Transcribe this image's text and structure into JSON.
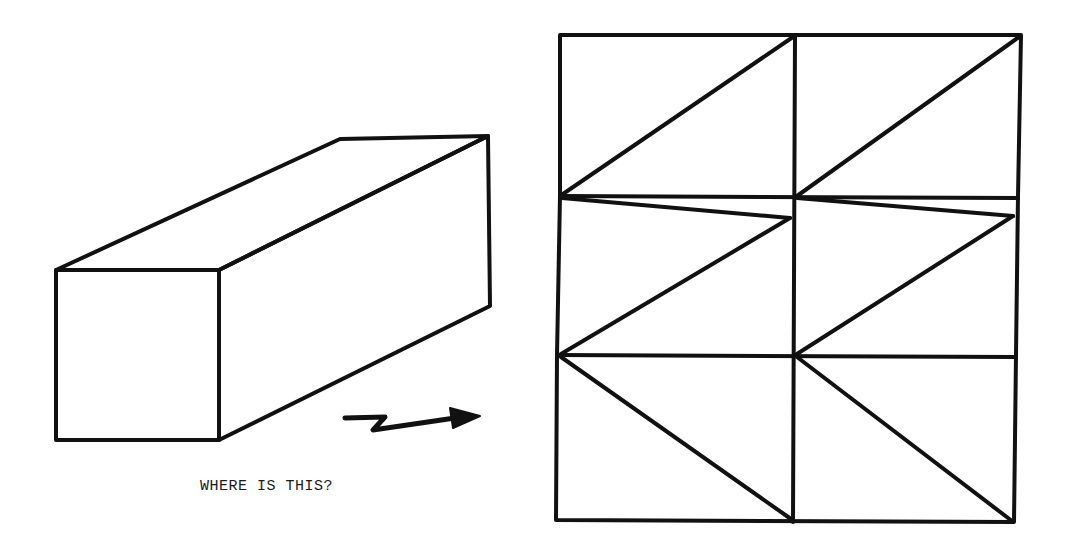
{
  "diagram": {
    "caption": "WHERE IS THIS?",
    "stroke_color": "#111111",
    "background_color": "#ffffff",
    "objects": [
      {
        "name": "rectangular-prism",
        "description": "3D rectangular box drawn in oblique projection"
      },
      {
        "name": "direction-arrow",
        "description": "Zig-zag arrow pointing right toward the grid"
      },
      {
        "name": "folding-net-grid",
        "description": "2 columns x 3 rows grid with diagonal lines in each cell"
      }
    ],
    "grid": {
      "columns": 2,
      "rows": 3,
      "cells": [
        {
          "row": 1,
          "col": 1,
          "diagonal": "bottom-left to top-right"
        },
        {
          "row": 1,
          "col": 2,
          "diagonal": "bottom-left to top-right"
        },
        {
          "row": 2,
          "col": 1,
          "diagonal": "bottom-left to top-right, with thin sliver from top-left"
        },
        {
          "row": 2,
          "col": 2,
          "diagonal": "bottom-left to top-right, with thin sliver from top-left"
        },
        {
          "row": 3,
          "col": 1,
          "diagonal": "top-left to bottom-right"
        },
        {
          "row": 3,
          "col": 2,
          "diagonal": "top-left to bottom-right"
        }
      ]
    }
  }
}
